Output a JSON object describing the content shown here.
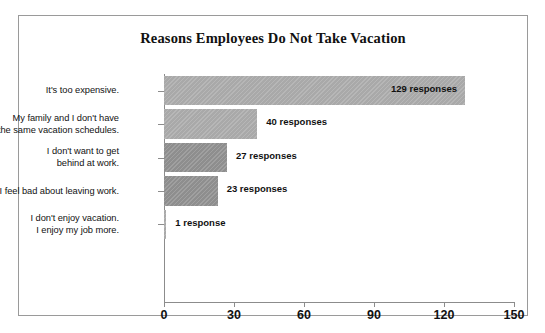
{
  "chart_data": {
    "type": "bar",
    "orientation": "horizontal",
    "title": "Reasons Employees Do Not Take Vacation",
    "xlabel": "",
    "ylabel": "",
    "xlim": [
      0,
      150
    ],
    "xticks": [
      0,
      30,
      60,
      90,
      120,
      150
    ],
    "grid": false,
    "legend": "none",
    "categories": [
      "It's too expensive.",
      "My family and I don't have the same vacation schedules.",
      "I don't want to get behind at work.",
      "I feel bad about leaving work.",
      "I don't enjoy vacation. I enjoy my job more."
    ],
    "values": [
      129,
      40,
      27,
      23,
      1
    ],
    "value_labels": [
      "129 responses",
      "40 responses",
      "27 responses",
      "23 responses",
      "1 response"
    ],
    "bar_colors": [
      "#a9a9a9",
      "#a9a9a9",
      "#8e8e8e",
      "#8e8e8e",
      "#a9a9a9"
    ],
    "label_placement": [
      "inside",
      "outside",
      "outside",
      "outside",
      "outside"
    ]
  },
  "categories_lines": [
    [
      "It's too expensive."
    ],
    [
      "My family and I don't have",
      "the same vacation schedules."
    ],
    [
      "I don't want to get",
      "behind at work."
    ],
    [
      "I feel bad about leaving work."
    ],
    [
      "I don't enjoy vacation.",
      "I enjoy my job more."
    ]
  ],
  "axis": {
    "tick_0": "0",
    "tick_30": "30",
    "tick_60": "60",
    "tick_90": "90",
    "tick_120": "120",
    "tick_150": "150"
  },
  "values": {
    "v0": "129 responses",
    "v1": "40 responses",
    "v2": "27 responses",
    "v3": "23 responses",
    "v4": "1 response"
  },
  "colors": {
    "bar_light": "#a9a9a9",
    "bar_dark": "#8e8e8e",
    "axis": "#8c8c8c",
    "frame": "#9a9a9a",
    "text": "#111111",
    "background": "#ffffff"
  }
}
